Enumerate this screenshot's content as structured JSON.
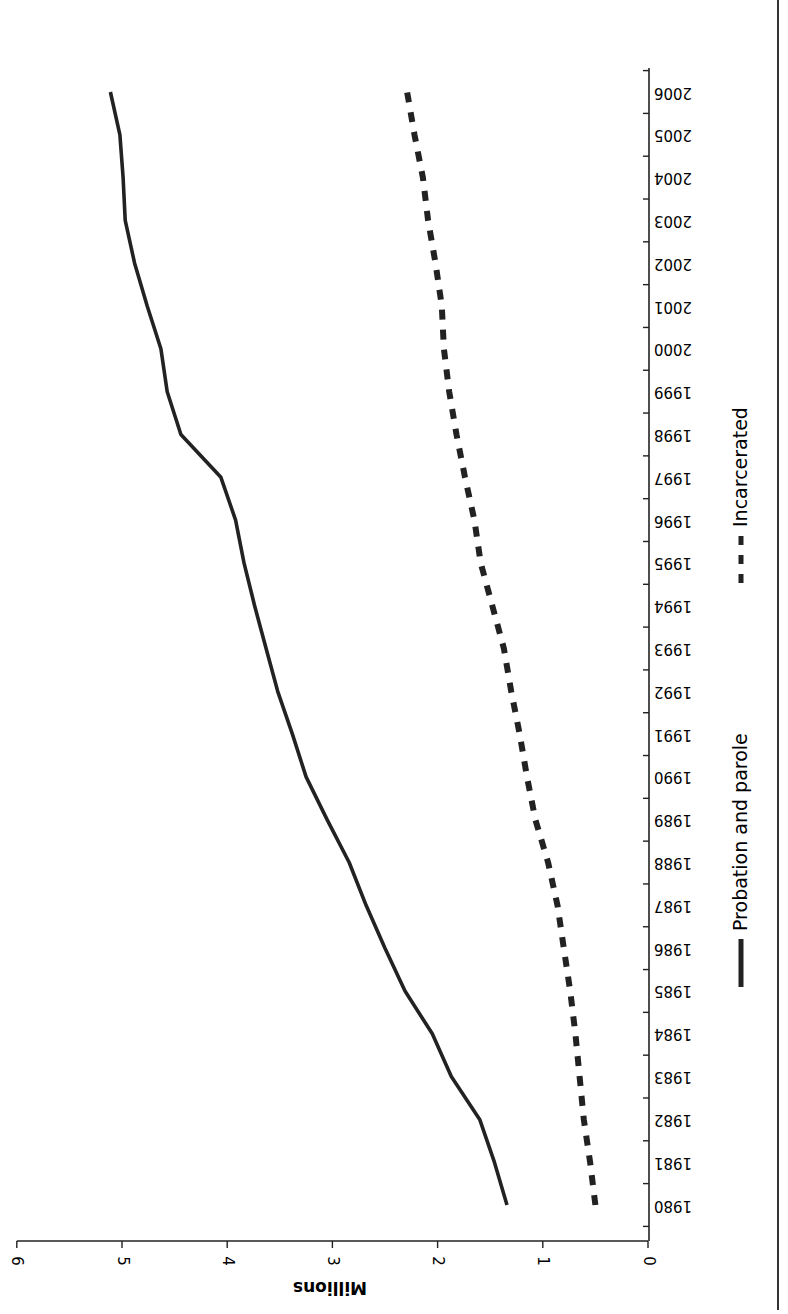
{
  "chart_data": {
    "type": "line",
    "title": "",
    "xlabel": "",
    "ylabel": "Millions",
    "ylim": [
      0,
      6
    ],
    "yticks": [
      0,
      1,
      2,
      3,
      4,
      5,
      6
    ],
    "grid": false,
    "legend_position": "bottom",
    "orientation": "rotated-90",
    "categories": [
      "1980",
      "1981",
      "1982",
      "1983",
      "1984",
      "1985",
      "1986",
      "1987",
      "1988",
      "1989",
      "1990",
      "1991",
      "1992",
      "1993",
      "1994",
      "1995",
      "1996",
      "1997",
      "1998",
      "1999",
      "2000",
      "2001",
      "2002",
      "2003",
      "2004",
      "2005",
      "2006"
    ],
    "series": [
      {
        "name": "Probation and parole",
        "style": "solid",
        "color": "#222222",
        "values": [
          1.34,
          1.46,
          1.6,
          1.87,
          2.05,
          2.31,
          2.5,
          2.68,
          2.84,
          3.05,
          3.25,
          3.38,
          3.52,
          3.63,
          3.74,
          3.84,
          3.92,
          4.06,
          4.44,
          4.57,
          4.63,
          4.76,
          4.88,
          4.97,
          4.99,
          5.02,
          5.11
        ]
      },
      {
        "name": "Incarcerated",
        "style": "dashed",
        "color": "#222222",
        "values": [
          0.5,
          0.55,
          0.61,
          0.65,
          0.69,
          0.74,
          0.8,
          0.86,
          0.95,
          1.07,
          1.15,
          1.22,
          1.3,
          1.37,
          1.48,
          1.59,
          1.65,
          1.74,
          1.82,
          1.89,
          1.94,
          1.96,
          2.02,
          2.09,
          2.14,
          2.22,
          2.29
        ]
      }
    ]
  }
}
